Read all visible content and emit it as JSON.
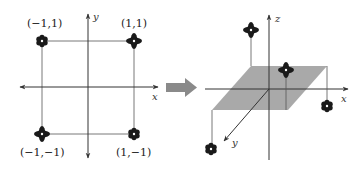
{
  "left_plot": {
    "axes": {
      "x_label": "x",
      "y_label": "y"
    },
    "points": [
      {
        "label": "(−1,1)",
        "marker": "flower"
      },
      {
        "label": "(1,1)",
        "marker": "cross"
      },
      {
        "label": "(−1,−1)",
        "marker": "cross"
      },
      {
        "label": "(1,−1)",
        "marker": "flower"
      }
    ]
  },
  "transform_arrow": {
    "color": "#8a8a8a"
  },
  "right_plot": {
    "axes": {
      "x_label": "x",
      "y_label": "y",
      "z_label": "z"
    },
    "plane_color": "#a9a9a9",
    "points": [
      {
        "marker": "cross",
        "position": "above-plane"
      },
      {
        "marker": "cross",
        "position": "above-plane"
      },
      {
        "marker": "flower",
        "position": "below-plane"
      },
      {
        "marker": "flower",
        "position": "below-plane"
      }
    ]
  },
  "colors": {
    "marker": "#1a1a1a",
    "axis": "#333333",
    "guide": "#555555"
  }
}
